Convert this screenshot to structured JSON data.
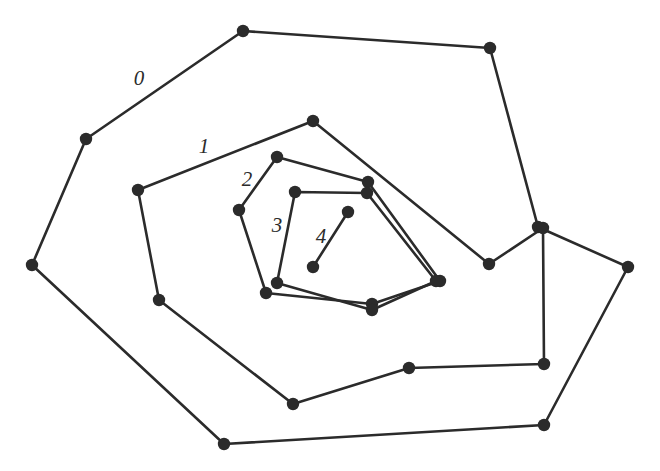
{
  "figure": {
    "width": 660,
    "height": 471,
    "background_color": "#ffffff",
    "ink_color": "#2b2b2b",
    "stroke_width": 2.6,
    "vertex_radius": 6.2
  },
  "chart_data": {
    "type": "scatter",
    "title": "",
    "xlabel": "",
    "ylabel": "",
    "xlim": [
      0,
      660
    ],
    "ylim": [
      0,
      471
    ],
    "grid": false,
    "legend_position": "none",
    "layers": [
      {
        "label": "0",
        "label_position": [
          139,
          80
        ],
        "closed": true,
        "point_count": 9,
        "points": [
          [
            243,
            31
          ],
          [
            490,
            48
          ],
          [
            538,
            227
          ],
          [
            628,
            267
          ],
          [
            544,
            425
          ],
          [
            224,
            444
          ],
          [
            32,
            265
          ],
          [
            86,
            139
          ]
        ]
      },
      {
        "label": "1",
        "label_position": [
          204,
          148
        ],
        "closed": true,
        "point_count": 8,
        "points": [
          [
            313,
            121
          ],
          [
            489,
            264
          ],
          [
            543,
            228
          ],
          [
            544,
            364
          ],
          [
            409,
            368
          ],
          [
            293,
            404
          ],
          [
            159,
            300
          ],
          [
            138,
            190
          ]
        ]
      },
      {
        "label": "2",
        "label_position": [
          247,
          181
        ],
        "closed": true,
        "point_count": 6,
        "points": [
          [
            277,
            157
          ],
          [
            368,
            182
          ],
          [
            440,
            281
          ],
          [
            372,
            304
          ],
          [
            266,
            293
          ],
          [
            239,
            210
          ]
        ]
      },
      {
        "label": "3",
        "label_position": [
          277,
          227
        ],
        "closed": true,
        "point_count": 5,
        "points": [
          [
            295,
            192
          ],
          [
            367,
            193
          ],
          [
            436,
            281
          ],
          [
            372,
            310
          ],
          [
            277,
            283
          ]
        ]
      },
      {
        "label": "4",
        "label_position": [
          321,
          238
        ],
        "closed": false,
        "point_count": 2,
        "points": [
          [
            348,
            212
          ],
          [
            313,
            267
          ]
        ]
      }
    ]
  }
}
